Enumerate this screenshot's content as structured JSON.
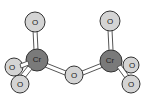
{
  "diagram": {
    "colors": {
      "oxygen_fill": "#d4d4d4",
      "chromium_fill": "#7a7a7a",
      "outline": "#333333",
      "bond": "#555555"
    },
    "atoms": [
      {
        "id": "o_top_left",
        "label": "O",
        "x": 35,
        "y": 22,
        "r": 10
      },
      {
        "id": "cr_left",
        "label": "Cr",
        "x": 37,
        "y": 60,
        "r": 11
      },
      {
        "id": "o_back_left",
        "label": "O",
        "x": 14,
        "y": 67,
        "r": 9
      },
      {
        "id": "o_bottom_left",
        "label": "O",
        "x": 20,
        "y": 84,
        "r": 9
      },
      {
        "id": "o_bridge",
        "label": "O",
        "x": 74,
        "y": 75,
        "r": 9
      },
      {
        "id": "o_top_right",
        "label": "O",
        "x": 110,
        "y": 21,
        "r": 10
      },
      {
        "id": "cr_right",
        "label": "Cr",
        "x": 111,
        "y": 61,
        "r": 11
      },
      {
        "id": "o_back_right",
        "label": "O",
        "x": 131,
        "y": 65,
        "r": 8
      },
      {
        "id": "o_bottom_right",
        "label": "O",
        "x": 131,
        "y": 84,
        "r": 9
      }
    ],
    "labels": {
      "o_top_left": "O",
      "cr_left": "Cr",
      "o_back_left": "O",
      "o_bottom_left": "O",
      "o_bridge": "O",
      "o_top_right": "O",
      "cr_right": "Cr",
      "o_back_right": "O",
      "o_bottom_right": "O"
    }
  }
}
